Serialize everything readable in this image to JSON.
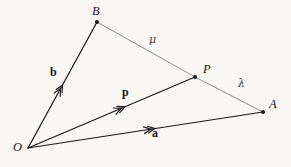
{
  "figure": {
    "width": 291,
    "height": 167,
    "background_color": "#f8f7f3",
    "vector_stroke_color": "#1a1b1f",
    "segment_stroke_color": "#8e8f93",
    "label_color": "#15161a"
  },
  "points": [
    {
      "name": "O",
      "label": "O",
      "x": 28,
      "y": 148,
      "label_x": 13,
      "label_y": 147,
      "dot": false
    },
    {
      "name": "B",
      "label": "B",
      "x": 97,
      "y": 22,
      "label_x": 92,
      "label_y": 6,
      "dot": true
    },
    {
      "name": "P",
      "label": "P",
      "x": 195,
      "y": 77,
      "label_x": 203,
      "label_y": 64,
      "dot": true
    },
    {
      "name": "A",
      "label": "A",
      "x": 263,
      "y": 112,
      "label_x": 270,
      "label_y": 99,
      "dot": true
    }
  ],
  "vectors": [
    {
      "name": "b",
      "label": "b",
      "from": "O",
      "to": "B",
      "label_x": 50,
      "label_y": 67,
      "arrow_t": 0.5
    },
    {
      "name": "p",
      "label": "p",
      "from": "O",
      "to": "P",
      "label_x": 122,
      "label_y": 87,
      "arrow_t": 0.58
    },
    {
      "name": "a",
      "label": "a",
      "from": "O",
      "to": "A",
      "label_x": 152,
      "label_y": 128,
      "arrow_t": 0.54
    }
  ],
  "segments": [
    {
      "name": "B-to-P",
      "from": "B",
      "to": "P",
      "label": "μ",
      "label_x": 149,
      "label_y": 36
    },
    {
      "name": "P-to-A",
      "from": "P",
      "to": "A",
      "label": "λ",
      "label_x": 238,
      "label_y": 80
    }
  ],
  "greek_labels": [
    {
      "name": "mu",
      "text": "μ",
      "x": 149,
      "y": 36
    },
    {
      "name": "lambda",
      "text": "λ",
      "x": 238,
      "y": 80
    }
  ]
}
